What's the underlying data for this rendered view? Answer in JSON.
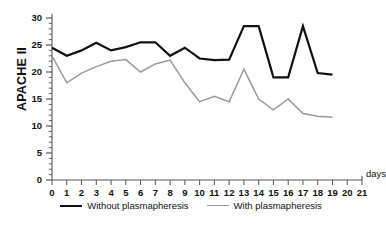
{
  "chart_data": {
    "type": "line",
    "title": "",
    "xlabel": "days",
    "ylabel": "APACHE II",
    "xlim": [
      0,
      21
    ],
    "ylim": [
      0,
      30
    ],
    "grid": false,
    "legend_position": "bottom",
    "x": [
      0,
      1,
      2,
      3,
      4,
      5,
      6,
      7,
      8,
      9,
      10,
      11,
      12,
      13,
      14,
      15,
      16,
      17,
      18,
      19,
      20,
      21
    ],
    "xtick_labels": [
      "0",
      "1",
      "2",
      "3",
      "4",
      "5",
      "6",
      "7",
      "8",
      "9",
      "10",
      "11",
      "12",
      "13",
      "14",
      "15",
      "16",
      "17",
      "18",
      "19",
      "20",
      "21"
    ],
    "ytick_labels": [
      "0",
      "5",
      "10",
      "15",
      "20",
      "25",
      "30"
    ],
    "ytick_values": [
      0,
      5,
      10,
      15,
      20,
      25,
      30
    ],
    "y_minor_tick_step": 1,
    "series": [
      {
        "name": "Without plasmapheresis",
        "color": "#111111",
        "x": [
          0,
          1,
          2,
          3,
          4,
          5,
          6,
          7,
          8,
          9,
          10,
          11,
          12,
          13,
          14,
          15,
          16,
          17,
          18,
          19
        ],
        "values": [
          24.5,
          23.0,
          24.0,
          25.4,
          24.0,
          24.6,
          25.5,
          25.5,
          23.0,
          24.5,
          22.5,
          22.2,
          22.3,
          28.5,
          28.5,
          19.0,
          19.0,
          28.5,
          19.8,
          19.5
        ]
      },
      {
        "name": "With plasmapheresis",
        "color": "#9a9a9a",
        "x": [
          0,
          1,
          2,
          3,
          4,
          5,
          6,
          7,
          8,
          9,
          10,
          11,
          12,
          13,
          14,
          15,
          16,
          17,
          18,
          19
        ],
        "values": [
          23.0,
          18.0,
          19.8,
          21.0,
          22.0,
          22.3,
          20.0,
          21.5,
          22.2,
          18.0,
          14.5,
          15.5,
          14.5,
          20.5,
          15.0,
          13.0,
          15.0,
          12.3,
          11.8,
          11.6
        ]
      }
    ]
  },
  "legend": {
    "items": [
      {
        "label": "Without plasmapheresis"
      },
      {
        "label": "With plasmapheresis"
      }
    ]
  },
  "axis": {
    "y_title": "APACHE II",
    "x_unit": "days"
  }
}
